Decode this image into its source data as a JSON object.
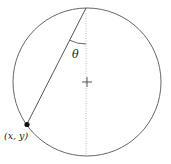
{
  "diagram": {
    "labels": {
      "angle": "θ",
      "point": "(x, y)"
    },
    "colors": {
      "stroke": "#555555",
      "dotted": "#aaaaaa",
      "point": "#111111"
    }
  }
}
